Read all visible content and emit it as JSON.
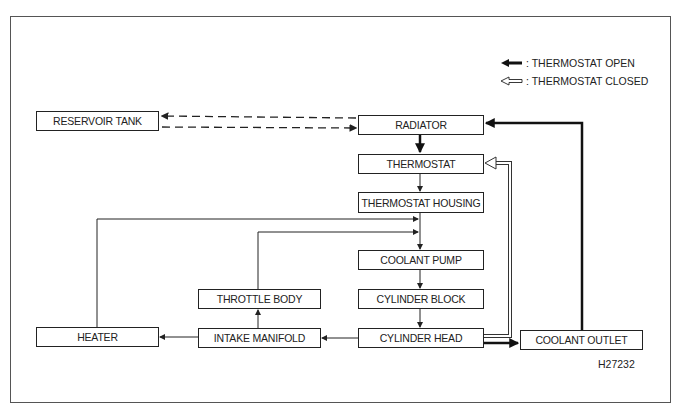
{
  "diagram": {
    "legend": [
      {
        "symbol": "solid-arrow",
        "label": ": THERMOSTAT OPEN"
      },
      {
        "symbol": "hollow-arrow",
        "label": ": THERMOSTAT CLOSED"
      }
    ],
    "nodes": {
      "reservoir_tank": "RESERVOIR TANK",
      "radiator": "RADIATOR",
      "thermostat": "THERMOSTAT",
      "thermostat_housing": "THERMOSTAT HOUSING",
      "coolant_pump": "COOLANT PUMP",
      "cylinder_block": "CYLINDER BLOCK",
      "cylinder_head": "CYLINDER HEAD",
      "throttle_body": "THROTTLE BODY",
      "intake_manifold": "INTAKE MANIFOLD",
      "heater": "HEATER",
      "coolant_outlet": "COOLANT OUTLET"
    },
    "edges": [
      {
        "from": "radiator",
        "to": "reservoir_tank",
        "style": "dashed"
      },
      {
        "from": "reservoir_tank",
        "to": "radiator",
        "style": "dashed"
      },
      {
        "from": "radiator",
        "to": "thermostat",
        "style": "thermostat-open"
      },
      {
        "from": "thermostat",
        "to": "thermostat_housing",
        "style": "normal"
      },
      {
        "from": "thermostat_housing",
        "to": "coolant_pump",
        "style": "normal"
      },
      {
        "from": "coolant_pump",
        "to": "cylinder_block",
        "style": "normal"
      },
      {
        "from": "cylinder_block",
        "to": "cylinder_head",
        "style": "normal"
      },
      {
        "from": "cylinder_head",
        "to": "intake_manifold",
        "style": "normal"
      },
      {
        "from": "intake_manifold",
        "to": "heater",
        "style": "normal"
      },
      {
        "from": "intake_manifold",
        "to": "throttle_body",
        "style": "normal"
      },
      {
        "from": "heater",
        "to": "coolant_pump",
        "style": "normal"
      },
      {
        "from": "throttle_body",
        "to": "coolant_pump",
        "style": "normal"
      },
      {
        "from": "cylinder_head",
        "to": "coolant_outlet",
        "style": "thermostat-open"
      },
      {
        "from": "coolant_outlet",
        "to": "radiator",
        "style": "thermostat-open"
      },
      {
        "from": "cylinder_head",
        "to": "thermostat",
        "style": "thermostat-closed"
      }
    ],
    "figure_code": "H27232"
  }
}
